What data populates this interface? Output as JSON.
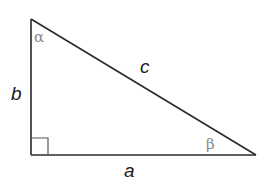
{
  "diagram": {
    "type": "right-triangle",
    "vertices": {
      "top": [
        31,
        19
      ],
      "right_angle": [
        31,
        155
      ],
      "right": [
        256,
        155
      ]
    },
    "right_angle_marker_size": 17,
    "colors": {
      "stroke": "#2a2a2a",
      "right_angle_marker": "#555555",
      "side_label": "#1a1a1a",
      "angle_label": "#8a8a8a",
      "background": "#ffffff"
    },
    "labels": {
      "side_a": "a",
      "side_b": "b",
      "side_c": "c",
      "angle_alpha": "α",
      "angle_beta": "β"
    }
  }
}
